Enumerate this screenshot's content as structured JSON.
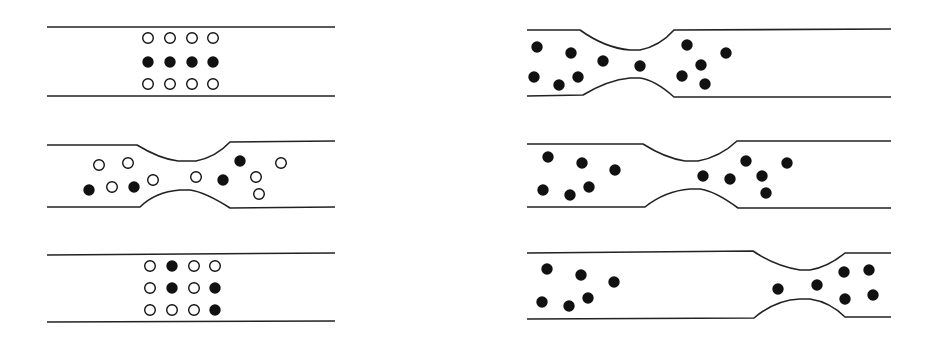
{
  "colors": {
    "line": "#222222",
    "filled": "#111111",
    "open_fill": "#ffffff",
    "background": "#ffffff"
  },
  "panels": [
    {
      "id": "left-1",
      "description": "straight channel, regular 4x3 array; middle row filled",
      "top_path": "M47,27 L335,27",
      "bottom_path": "M47,96 L335,96",
      "particles": [
        {
          "x": 148,
          "y": 38,
          "f": 0
        },
        {
          "x": 170,
          "y": 38,
          "f": 0
        },
        {
          "x": 192,
          "y": 38,
          "f": 0
        },
        {
          "x": 213,
          "y": 38,
          "f": 0
        },
        {
          "x": 148,
          "y": 62,
          "f": 1
        },
        {
          "x": 170,
          "y": 62,
          "f": 1
        },
        {
          "x": 192,
          "y": 62,
          "f": 1
        },
        {
          "x": 213,
          "y": 62,
          "f": 1
        },
        {
          "x": 148,
          "y": 84,
          "f": 0
        },
        {
          "x": 170,
          "y": 84,
          "f": 0
        },
        {
          "x": 192,
          "y": 84,
          "f": 0
        },
        {
          "x": 213,
          "y": 84,
          "f": 0
        }
      ]
    },
    {
      "id": "left-2",
      "description": "constricted channel, particles scattered and mixed",
      "top_path": "M47,145 L137,145 Q160,159 178,161 L196,161 Q216,157 230,142 L335,141",
      "bottom_path": "M47,207 L140,207 Q155,192 180,190 L190,190 Q205,192 230,208 L335,207",
      "particles": [
        {
          "x": 99,
          "y": 165,
          "f": 0
        },
        {
          "x": 128,
          "y": 163,
          "f": 0
        },
        {
          "x": 89,
          "y": 190,
          "f": 1
        },
        {
          "x": 112,
          "y": 187,
          "f": 0
        },
        {
          "x": 134,
          "y": 187,
          "f": 1
        },
        {
          "x": 153,
          "y": 180,
          "f": 0
        },
        {
          "x": 196,
          "y": 177,
          "f": 0
        },
        {
          "x": 223,
          "y": 180,
          "f": 1
        },
        {
          "x": 240,
          "y": 161,
          "f": 1
        },
        {
          "x": 256,
          "y": 177,
          "f": 0
        },
        {
          "x": 281,
          "y": 163,
          "f": 0
        },
        {
          "x": 259,
          "y": 194,
          "f": 0
        }
      ]
    },
    {
      "id": "left-3",
      "description": "straight channel, array restored but filled particles displaced",
      "top_path": "M47,255 L335,253",
      "bottom_path": "M47,322 L335,321",
      "particles": [
        {
          "x": 150,
          "y": 266,
          "f": 0
        },
        {
          "x": 172,
          "y": 266,
          "f": 1
        },
        {
          "x": 194,
          "y": 266,
          "f": 0
        },
        {
          "x": 215,
          "y": 266,
          "f": 0
        },
        {
          "x": 150,
          "y": 288,
          "f": 0
        },
        {
          "x": 172,
          "y": 288,
          "f": 1
        },
        {
          "x": 194,
          "y": 288,
          "f": 0
        },
        {
          "x": 215,
          "y": 288,
          "f": 1
        },
        {
          "x": 150,
          "y": 310,
          "f": 0
        },
        {
          "x": 172,
          "y": 310,
          "f": 0
        },
        {
          "x": 194,
          "y": 310,
          "f": 0
        },
        {
          "x": 215,
          "y": 310,
          "f": 1
        }
      ]
    },
    {
      "id": "right-1",
      "description": "constriction near left end, all particles filled",
      "top_path": "M527,30 L580,30 Q605,48 630,50 L640,50 Q660,46 674,30 L891,29",
      "bottom_path": "M527,96 L583,95 Q608,80 630,78 L640,78 Q655,80 674,97 L891,97",
      "particles": [
        {
          "x": 537,
          "y": 47,
          "f": 1
        },
        {
          "x": 571,
          "y": 53,
          "f": 1
        },
        {
          "x": 603,
          "y": 61,
          "f": 1
        },
        {
          "x": 640,
          "y": 66,
          "f": 1
        },
        {
          "x": 687,
          "y": 45,
          "f": 1
        },
        {
          "x": 726,
          "y": 53,
          "f": 1
        },
        {
          "x": 701,
          "y": 65,
          "f": 1
        },
        {
          "x": 534,
          "y": 77,
          "f": 1
        },
        {
          "x": 559,
          "y": 85,
          "f": 1
        },
        {
          "x": 578,
          "y": 77,
          "f": 1
        },
        {
          "x": 682,
          "y": 76,
          "f": 1
        },
        {
          "x": 705,
          "y": 84,
          "f": 1
        }
      ]
    },
    {
      "id": "right-2",
      "description": "constriction in middle",
      "top_path": "M527,144 L643,144 Q665,158 685,161 L698,161 Q720,157 737,141 L891,141",
      "bottom_path": "M527,207 L645,207 Q665,191 690,189 L700,189 Q715,191 738,208 L891,208",
      "particles": [
        {
          "x": 548,
          "y": 157,
          "f": 1
        },
        {
          "x": 582,
          "y": 163,
          "f": 1
        },
        {
          "x": 615,
          "y": 170,
          "f": 1
        },
        {
          "x": 543,
          "y": 190,
          "f": 1
        },
        {
          "x": 570,
          "y": 195,
          "f": 1
        },
        {
          "x": 589,
          "y": 187,
          "f": 1
        },
        {
          "x": 703,
          "y": 176,
          "f": 1
        },
        {
          "x": 730,
          "y": 179,
          "f": 1
        },
        {
          "x": 746,
          "y": 161,
          "f": 1
        },
        {
          "x": 762,
          "y": 176,
          "f": 1
        },
        {
          "x": 787,
          "y": 163,
          "f": 1
        },
        {
          "x": 766,
          "y": 193,
          "f": 1
        }
      ]
    },
    {
      "id": "right-3",
      "description": "constriction near right end",
      "top_path": "M527,253 L753,251 Q775,266 800,270 L810,270 Q828,267 845,253 L891,253",
      "bottom_path": "M527,319 L754,318 Q775,300 800,299 L810,299 Q830,302 845,317 L891,317",
      "particles": [
        {
          "x": 547,
          "y": 269,
          "f": 1
        },
        {
          "x": 581,
          "y": 275,
          "f": 1
        },
        {
          "x": 614,
          "y": 282,
          "f": 1
        },
        {
          "x": 542,
          "y": 302,
          "f": 1
        },
        {
          "x": 569,
          "y": 306,
          "f": 1
        },
        {
          "x": 588,
          "y": 298,
          "f": 1
        },
        {
          "x": 778,
          "y": 289,
          "f": 1
        },
        {
          "x": 817,
          "y": 285,
          "f": 1
        },
        {
          "x": 844,
          "y": 272,
          "f": 1
        },
        {
          "x": 869,
          "y": 270,
          "f": 1
        },
        {
          "x": 845,
          "y": 299,
          "f": 1
        },
        {
          "x": 873,
          "y": 295,
          "f": 1
        }
      ]
    }
  ],
  "particle_radius": 5.3
}
